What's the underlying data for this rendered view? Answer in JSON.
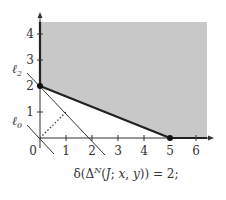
{
  "figure": {
    "type": "newton-polygon-diagram",
    "x_ticks": [
      "0",
      "1",
      "2",
      "3",
      "4",
      "5",
      "6"
    ],
    "y_ticks": [
      "1",
      "2",
      "3",
      "4"
    ],
    "origin_label": "0",
    "line_labels": {
      "l2": "ℓ",
      "l2_sub": "2",
      "l0": "ℓ",
      "l0_sub": "0"
    },
    "vertices": [
      {
        "x": 0,
        "y": 2
      },
      {
        "x": 5,
        "y": 0
      }
    ],
    "colors": {
      "shaded_region": "#c8c8c8",
      "axis": "#333333",
      "boundary": "#222222"
    }
  },
  "caption": {
    "delta": "δ(Δ",
    "sup": "N",
    "args_open": "(",
    "J": "J",
    "semi": "; ",
    "x": "x",
    "comma": ", ",
    "y": "y",
    "close": ")) = 2;"
  }
}
